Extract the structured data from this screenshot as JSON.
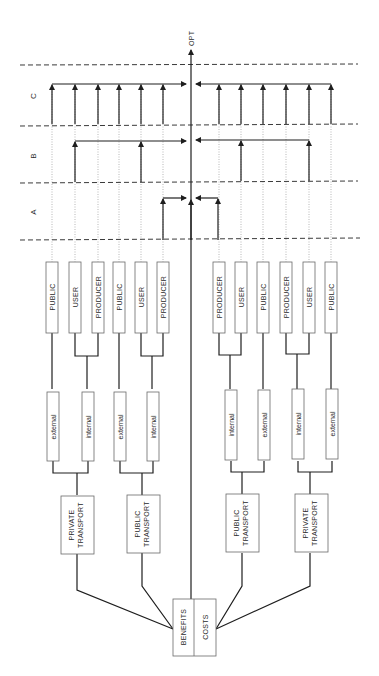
{
  "diagram": {
    "colors": {
      "line": "#1e1e1e",
      "box": "#6a6a6a",
      "dash": "#3a3a3a",
      "dot": "#9a9a9a",
      "text": "#2a2a2a",
      "bg": "#ffffff"
    },
    "opt_label": "OPT",
    "zones": [
      {
        "id": "C",
        "label": "C",
        "y_top": 65,
        "y_bottom": 124
      },
      {
        "id": "B",
        "label": "B",
        "y_top": 124,
        "y_bottom": 181
      },
      {
        "id": "A",
        "label": "A",
        "y_top": 181,
        "y_bottom": 240
      }
    ],
    "root_box": {
      "left_label": "BENEFITS",
      "right_label": "COSTS"
    },
    "transport_boxes": [
      {
        "label_line1": "PRIVATE",
        "label_line2": "TRANSPORT",
        "side": "benefits"
      },
      {
        "label_line1": "PUBLIC",
        "label_line2": "TRANSPORT",
        "side": "benefits"
      },
      {
        "label_line1": "PUBLIC",
        "label_line2": "TRANSPORT",
        "side": "costs"
      },
      {
        "label_line1": "PRIVATE",
        "label_line2": "TRANSPORT",
        "side": "costs"
      }
    ],
    "effect_boxes": [
      {
        "label": "external"
      },
      {
        "label": "internal"
      },
      {
        "label": "external"
      },
      {
        "label": "internal"
      },
      {
        "label": "internal"
      },
      {
        "label": "external"
      },
      {
        "label": "internal"
      },
      {
        "label": "external"
      }
    ],
    "actor_boxes": [
      {
        "label": "PUBLIC"
      },
      {
        "label": "USER"
      },
      {
        "label": "PRODUCER"
      },
      {
        "label": "PUBLIC"
      },
      {
        "label": "USER"
      },
      {
        "label": "PRODUCER"
      },
      {
        "label": "PRODUCER"
      },
      {
        "label": "USER"
      },
      {
        "label": "PUBLIC"
      },
      {
        "label": "PRODUCER"
      },
      {
        "label": "USER"
      },
      {
        "label": "PUBLIC"
      }
    ]
  }
}
